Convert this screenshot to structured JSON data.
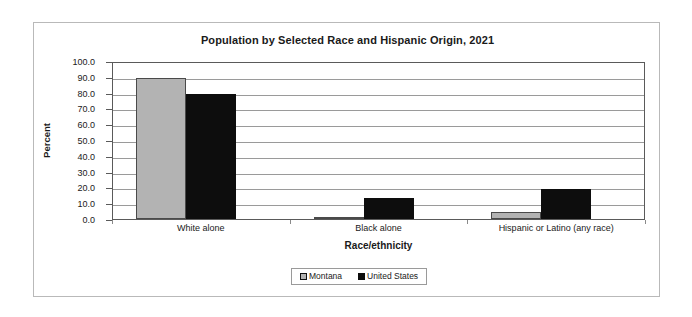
{
  "chart_data": {
    "type": "bar",
    "title": "Population by Selected Race and Hispanic Origin, 2021",
    "xlabel": "Race/ethnicity",
    "ylabel": "Percent",
    "categories": [
      "White alone",
      "Black alone",
      "Hispanic or Latino (any race)"
    ],
    "series": [
      {
        "name": "Montana",
        "color": "#b3b3b3",
        "values": [
          89.0,
          0.6,
          4.3
        ]
      },
      {
        "name": "United States",
        "color": "#0d0d0d",
        "values": [
          79.0,
          13.6,
          18.9
        ]
      }
    ],
    "ylim": [
      0,
      100
    ],
    "ytick_labels": [
      "0.0",
      "10.0",
      "20.0",
      "30.0",
      "40.0",
      "50.0",
      "60.0",
      "70.0",
      "80.0",
      "90.0",
      "100.0"
    ],
    "ytick_values": [
      0,
      10,
      20,
      30,
      40,
      50,
      60,
      70,
      80,
      90,
      100
    ],
    "grid": true,
    "legend_position": "bottom"
  }
}
